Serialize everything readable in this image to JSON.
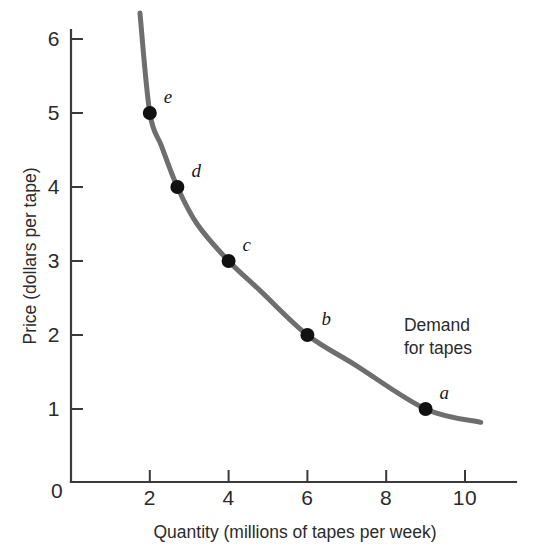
{
  "chart_data": {
    "type": "line",
    "title": "",
    "subtitle": "",
    "xlabel": "Quantity (millions of tapes per week)",
    "ylabel": "Price (dollars per tape)",
    "xlim": [
      0,
      11
    ],
    "ylim": [
      0,
      6.5
    ],
    "xticks": [
      "0",
      "2",
      "4",
      "6",
      "8",
      "10"
    ],
    "xtick_values": [
      0,
      2,
      4,
      6,
      8,
      10
    ],
    "yticks": [
      "1",
      "2",
      "3",
      "4",
      "5",
      "6"
    ],
    "ytick_values": [
      1,
      2,
      3,
      4,
      5,
      6
    ],
    "grid": false,
    "legend_position": "inline-annotation",
    "series": [
      {
        "name": "Demand for tapes",
        "type": "line",
        "color": "#6e6e6e",
        "line_width": 5,
        "x": [
          1.75,
          2.0,
          2.3,
          2.7,
          3.2,
          4.0,
          4.8,
          6.0,
          7.2,
          9.0,
          10.4
        ],
        "y": [
          6.35,
          5.0,
          4.55,
          4.0,
          3.5,
          3.0,
          2.6,
          2.0,
          1.6,
          1.0,
          0.82
        ]
      }
    ],
    "points": [
      {
        "label": "e",
        "x": 2.0,
        "y": 5.0,
        "label_dx": 14,
        "label_dy": -10
      },
      {
        "label": "d",
        "x": 2.7,
        "y": 4.0,
        "label_dx": 14,
        "label_dy": -10
      },
      {
        "label": "c",
        "x": 4.0,
        "y": 3.0,
        "label_dx": 14,
        "label_dy": -10
      },
      {
        "label": "b",
        "x": 6.0,
        "y": 2.0,
        "label_dx": 14,
        "label_dy": -10
      },
      {
        "label": "a",
        "x": 9.0,
        "y": 1.0,
        "label_dx": 14,
        "label_dy": -10
      }
    ],
    "point_color": "#111111",
    "point_radius": 7,
    "annotations": [
      {
        "name": "demand-curve-label",
        "lines": [
          "Demand",
          "for tapes"
        ],
        "x": 8.45,
        "y": 2.05
      }
    ],
    "axis_color": "#3a3a3a"
  }
}
